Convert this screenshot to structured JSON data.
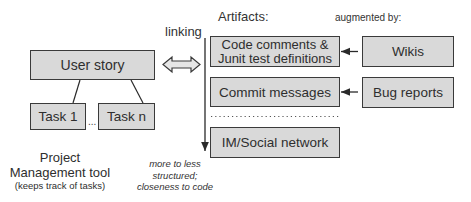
{
  "diagram": {
    "left": {
      "user_story": "User story",
      "task_1": "Task 1",
      "task_n": "Task n",
      "ellipsis": "...",
      "tool_title_line1": "Project",
      "tool_title_line2": "Management tool",
      "tool_subtitle": "(keeps track of tasks)"
    },
    "linking": {
      "label": "linking",
      "axis_caption_line1": "more to less",
      "axis_caption_line2": "structured;",
      "axis_caption_line3": "closeness to code"
    },
    "artifacts": {
      "header": "Artifacts:",
      "items": [
        {
          "line1": "Code comments &",
          "line2": "Junit test definitions"
        },
        {
          "line1": "Commit messages"
        },
        {
          "line1": "IM/Social network"
        }
      ]
    },
    "augmented": {
      "header": "augmented by:",
      "items": [
        {
          "label": "Wikis"
        },
        {
          "label": "Bug reports"
        }
      ]
    },
    "colors": {
      "box_fill": "#d9d9d9",
      "box_border": "#3a3a3a",
      "line": "#2a2a2a",
      "text": "#2e2e2e"
    }
  }
}
